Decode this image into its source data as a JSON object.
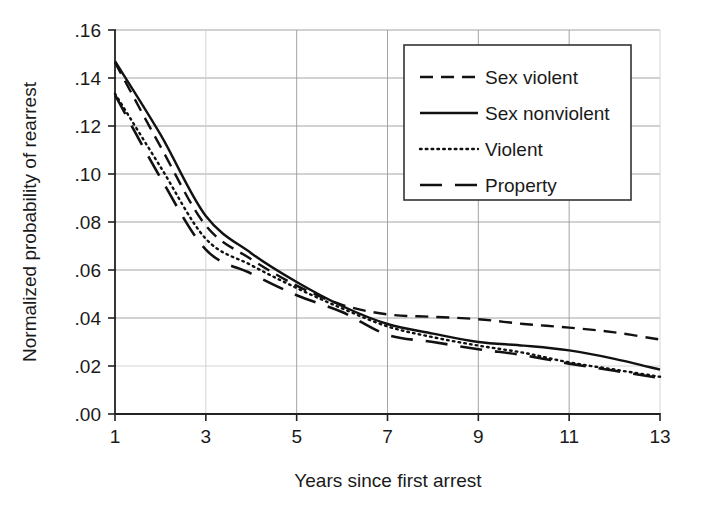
{
  "chart_data": {
    "type": "line",
    "title": "",
    "xlabel": "Years since first arrest",
    "ylabel": "Normalized probability of rearrest",
    "xlim": [
      1,
      13
    ],
    "ylim": [
      0.0,
      0.16
    ],
    "grid": true,
    "legend_position": "top-right",
    "x": [
      1,
      2,
      3,
      4,
      5,
      6,
      7,
      8,
      9,
      10,
      11,
      12,
      13
    ],
    "xticks": [
      "1",
      "3",
      "5",
      "7",
      "9",
      "11",
      "13"
    ],
    "xtick_values": [
      1,
      3,
      5,
      7,
      9,
      11,
      13
    ],
    "yticks": [
      ".00",
      ".02",
      ".04",
      ".06",
      ".08",
      ".10",
      ".12",
      ".14",
      ".16"
    ],
    "ytick_values": [
      0.0,
      0.02,
      0.04,
      0.06,
      0.08,
      0.1,
      0.12,
      0.14,
      0.16
    ],
    "series": [
      {
        "name": "Sex violent",
        "style": "dashed",
        "color": "#111111",
        "values": [
          0.1465,
          0.1115,
          0.0785,
          0.0645,
          0.0535,
          0.0455,
          0.0415,
          0.0405,
          0.0395,
          0.0375,
          0.036,
          0.034,
          0.031
        ]
      },
      {
        "name": "Sex nonviolent",
        "style": "solid",
        "color": "#111111",
        "values": [
          0.147,
          0.1165,
          0.0825,
          0.067,
          0.055,
          0.045,
          0.0375,
          0.0335,
          0.03,
          0.0285,
          0.0265,
          0.023,
          0.0185
        ]
      },
      {
        "name": "Violent",
        "style": "dotted",
        "color": "#111111",
        "values": [
          0.1335,
          0.103,
          0.073,
          0.062,
          0.0525,
          0.044,
          0.0365,
          0.032,
          0.0285,
          0.0255,
          0.0215,
          0.0185,
          0.0155
        ]
      },
      {
        "name": "Property",
        "style": "longdash",
        "color": "#111111",
        "values": [
          0.133,
          0.0985,
          0.0685,
          0.0585,
          0.0495,
          0.0425,
          0.033,
          0.03,
          0.027,
          0.0245,
          0.021,
          0.018,
          0.015
        ]
      }
    ]
  },
  "axes": {
    "x_title": "Years since first arrest",
    "y_title": "Normalized probability of rearrest"
  },
  "legend": {
    "entries": [
      {
        "label": "Sex violent"
      },
      {
        "label": "Sex nonviolent"
      },
      {
        "label": "Violent"
      },
      {
        "label": "Property"
      }
    ]
  }
}
